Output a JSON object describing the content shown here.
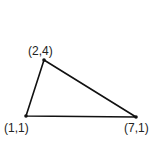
{
  "diagram": {
    "type": "triangle",
    "stroke_color": "#111111",
    "vertices": [
      {
        "label": "(2,4)",
        "x": 2,
        "y": 4
      },
      {
        "label": "(1,1)",
        "x": 1,
        "y": 1
      },
      {
        "label": "(7,1)",
        "x": 7,
        "y": 1
      }
    ]
  }
}
